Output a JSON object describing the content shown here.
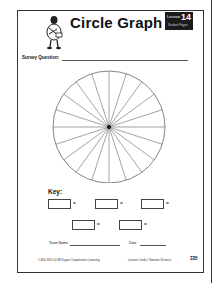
{
  "worksheet": {
    "title": "Circle Graph",
    "badge": {
      "label": "Lesson",
      "number": "14",
      "subtitle": "Student Pages"
    },
    "survey_question_label": "Survey Question:",
    "survey_question_value": "",
    "circle": {
      "segments": 20
    },
    "key": {
      "label": "Key:",
      "entries": [
        {
          "swatch": "",
          "value": ""
        },
        {
          "swatch": "",
          "value": ""
        },
        {
          "swatch": "",
          "value": ""
        },
        {
          "swatch": "",
          "value": ""
        },
        {
          "swatch": "",
          "value": ""
        }
      ],
      "equals": "="
    },
    "team_name_label": "Team Name",
    "date_label": "Date",
    "footer": {
      "left": "1-800-933-CLUE Kagan Cooperative Learning",
      "center": "Lesson Cards / Smarter Science",
      "page_number": "335"
    }
  }
}
